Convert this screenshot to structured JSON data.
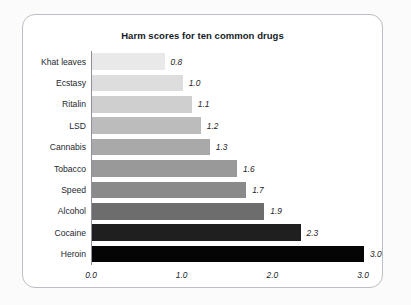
{
  "card": {
    "border_color": "#b9bfc4",
    "background": "#ffffff"
  },
  "page": {
    "background": "#fbfbfb"
  },
  "chart_data": {
    "type": "bar",
    "orientation": "horizontal",
    "title": "Harm scores for ten common drugs",
    "xlabel": "",
    "ylabel": "",
    "categories": [
      "Khat leaves",
      "Ecstasy",
      "Ritalin",
      "LSD",
      "Cannabis",
      "Tobacco",
      "Speed",
      "Alcohol",
      "Cocaine",
      "Heroin"
    ],
    "values": [
      0.8,
      1.0,
      1.1,
      1.2,
      1.3,
      1.6,
      1.7,
      1.9,
      2.3,
      3.0
    ],
    "value_labels": [
      "0.8",
      "1.0",
      "1.1",
      "1.2",
      "1.3",
      "1.6",
      "1.7",
      "1.9",
      "2.3",
      "3.0"
    ],
    "bar_colors": [
      "#e9e9e9",
      "#dddddd",
      "#cfcfcf",
      "#bcbcbc",
      "#a9a9a9",
      "#999999",
      "#8a8a8a",
      "#6d6d6d",
      "#1f1f1f",
      "#050505"
    ],
    "xlim": [
      0.0,
      3.0
    ],
    "xticks": [
      0.0,
      1.0,
      2.0,
      3.0
    ],
    "xtick_labels": [
      "0.0",
      "1.0",
      "2.0",
      "3.0"
    ],
    "grid": false,
    "legend": false
  }
}
